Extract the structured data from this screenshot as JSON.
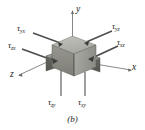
{
  "figure": {
    "caption": "(b)",
    "background_color": "#ffffff",
    "axes": [
      {
        "name": "y-axis",
        "label": "y"
      },
      {
        "name": "x-axis",
        "label": "x"
      },
      {
        "name": "z-axis",
        "label": "z"
      }
    ],
    "stress_labels": [
      {
        "name": "tau-yx",
        "symbol": "τ",
        "subscript": "yx",
        "position": "top-left"
      },
      {
        "name": "tau-yz",
        "symbol": "τ",
        "subscript": "yz",
        "position": "top-right"
      },
      {
        "name": "tau-zx",
        "symbol": "τ",
        "subscript": "zx",
        "position": "middle-left"
      },
      {
        "name": "tau-xz",
        "symbol": "τ",
        "subscript": "xz",
        "position": "middle-right"
      },
      {
        "name": "tau-zy",
        "symbol": "τ",
        "subscript": "zy",
        "position": "bottom-left"
      },
      {
        "name": "tau-xy",
        "symbol": "τ",
        "subscript": "xy",
        "position": "bottom-right"
      }
    ],
    "colors": {
      "cube_top": "#b5b5b0",
      "cube_front": "#8f8f8a",
      "cube_right": "#a3a39e",
      "cube_shadow": "#6e6e6a",
      "line": "#5a5a58",
      "text": "#1a1a1a"
    }
  }
}
